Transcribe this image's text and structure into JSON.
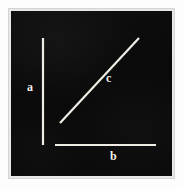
{
  "figure": {
    "background_color": "#0b0a0a",
    "stroke_color": "#efece4",
    "frame_color": "#e8e8e6",
    "segments": [
      {
        "id": "a",
        "label": "a",
        "role": "vertical-leg",
        "orientation": "vertical",
        "x1": 43,
        "y1": 38,
        "x2": 43,
        "y2": 145,
        "stroke_width": 2.2,
        "label_x": 31,
        "label_y": 88
      },
      {
        "id": "b",
        "label": "b",
        "role": "horizontal-leg",
        "orientation": "horizontal",
        "x1": 55,
        "y1": 145,
        "x2": 156,
        "y2": 145,
        "stroke_width": 2.2,
        "label_x": 114,
        "label_y": 157
      },
      {
        "id": "c",
        "label": "c",
        "role": "hypotenuse",
        "orientation": "diagonal",
        "x1": 60,
        "y1": 123,
        "x2": 139,
        "y2": 38,
        "stroke_width": 2.2,
        "label_x": 110,
        "label_y": 79
      }
    ]
  }
}
